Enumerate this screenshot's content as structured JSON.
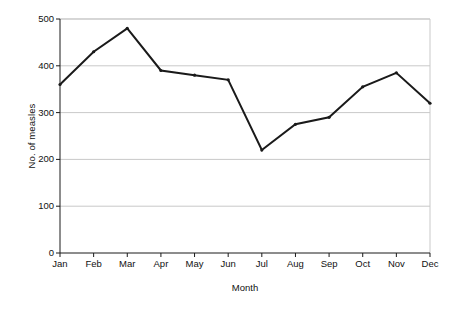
{
  "chart_data": {
    "type": "line",
    "title": "",
    "xlabel": "Month",
    "ylabel": "No. of measles",
    "categories": [
      "Jan",
      "Feb",
      "Mar",
      "Apr",
      "May",
      "Jun",
      "Jul",
      "Aug",
      "Sep",
      "Oct",
      "Nov",
      "Dec"
    ],
    "values": [
      360,
      430,
      480,
      390,
      380,
      370,
      220,
      275,
      290,
      355,
      385,
      320
    ],
    "series": [
      {
        "name": "No. of measles",
        "values": [
          360,
          430,
          480,
          390,
          380,
          370,
          220,
          275,
          290,
          355,
          385,
          320
        ]
      }
    ],
    "ylim": [
      0,
      500
    ],
    "yticks": [
      0,
      100,
      200,
      300,
      400,
      500
    ],
    "ytick_labels": [
      "0",
      "100",
      "200",
      "300",
      "400",
      "500"
    ],
    "grid": "horizontal",
    "legend": "none",
    "line_color": "#1a1a1a",
    "grid_color": "#c9c9c9",
    "axis_color": "#1a1a1a",
    "marker": "small-vertex-dot",
    "background": "#ffffff"
  }
}
